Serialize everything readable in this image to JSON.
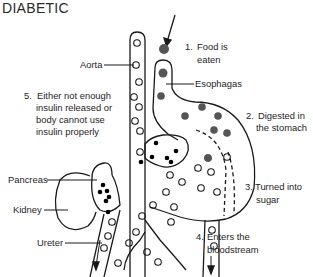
{
  "title": "DIABETIC",
  "labels": {
    "aorta": "Aorta",
    "esophagas": "Esophagas",
    "pancreas": "Pancreas",
    "kidney": "Kidney",
    "ureter": "Ureter"
  },
  "steps": [
    {
      "num": "1.",
      "line1": "Food is",
      "line2": "eaten"
    },
    {
      "num": "2.",
      "line1": "Digested in",
      "line2": "the stomach"
    },
    {
      "num": "3.",
      "line1": "Turned into",
      "line2": "sugar"
    },
    {
      "num": "4.",
      "line1": "Enters the",
      "line2": "bloodstream"
    },
    {
      "num": "5.",
      "line1": "Either not enough",
      "line2": "insulin released or",
      "line3": "body cannot use",
      "line4": "insulin properly"
    }
  ],
  "legend_icons": {
    "food_particle": "filled-gray-circle",
    "sugar": "hollow-circle",
    "insulin": "filled-black-dot"
  },
  "colors": {
    "line": "#1a1a1a",
    "food": "#555555",
    "insulin": "#000000"
  }
}
